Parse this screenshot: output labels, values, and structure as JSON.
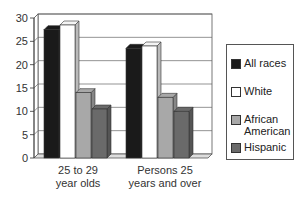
{
  "chart_data": {
    "type": "bar",
    "title": "",
    "xlabel": "",
    "ylabel": "",
    "categories": [
      "25 to 29 year olds",
      "Persons 25 years and over"
    ],
    "category_lines": [
      [
        "25 to 29",
        "year olds"
      ],
      [
        "Persons 25",
        "years and over"
      ]
    ],
    "series": [
      {
        "name": "All races",
        "color": "#1a1a1a",
        "values": [
          27.5,
          23.5
        ]
      },
      {
        "name": "White",
        "color": "#ffffff",
        "values": [
          28.5,
          24
        ]
      },
      {
        "name": "African American",
        "color": "#a8a8a8",
        "values": [
          14,
          13
        ]
      },
      {
        "name": "Hispanic",
        "color": "#6a6a6a",
        "values": [
          10.5,
          10
        ]
      }
    ],
    "yticks": [
      0,
      5,
      10,
      15,
      20,
      25,
      30
    ],
    "ylim": [
      0,
      30
    ],
    "grid": true,
    "legend_position": "right",
    "style": "3d"
  },
  "legend": {
    "items": [
      {
        "label": "All races",
        "color": "#1a1a1a"
      },
      {
        "label": "White",
        "color": "#ffffff"
      },
      {
        "label": "African American",
        "color": "#a8a8a8"
      },
      {
        "label": "Hispanic",
        "color": "#6a6a6a"
      }
    ]
  }
}
